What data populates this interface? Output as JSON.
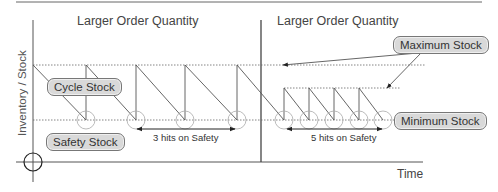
{
  "diagram": {
    "headings": {
      "left": "Larger Order Quantity",
      "right": "Larger Order Quantity"
    },
    "axes": {
      "y_label": "Inventory / Stock",
      "x_label": "Time"
    },
    "labels": {
      "cycle_stock": "Cycle Stock",
      "safety_stock": "Safety Stock",
      "maximum_stock": "Maximum Stock",
      "minimum_stock": "Minimum Stock"
    },
    "annotations": {
      "left_hits": "3 hits on Safety",
      "right_hits": "5 hits on Safety"
    },
    "colors": {
      "line": "#555555",
      "dotted": "#666666",
      "circle": "#aaaaaa",
      "pill_fill": "#d9d9d9"
    }
  }
}
